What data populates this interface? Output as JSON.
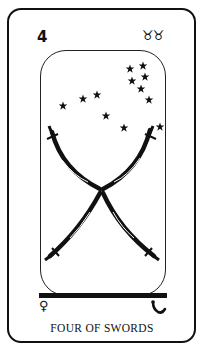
{
  "card": {
    "number": "4",
    "zodiac": "♉♉",
    "planet": "♀",
    "hebrew_letter_icon": "hebrew-letter-icon",
    "title": "FOUR OF SWORDS"
  },
  "illustration": {
    "subject": "two pairs of crossed curved swords forming an X beneath a cluster of stars",
    "star_count": 12,
    "sword_count": 4
  },
  "colors": {
    "ink": "#111111",
    "background": "#ffffff"
  }
}
